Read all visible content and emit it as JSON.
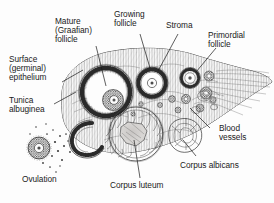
{
  "figure": {
    "ink_color": "#232323",
    "background_color": "#fdfdfd",
    "label_color": "#1a1a1a"
  },
  "labels": {
    "surface_epithelium": {
      "lines": [
        "Surface",
        "(germinal)",
        "epithelium"
      ],
      "line1": "Surface",
      "line2": "(germinal)",
      "line3": "epithelium"
    },
    "mature_follicle": {
      "lines": [
        "Mature",
        "(Graafian)",
        "follicle"
      ],
      "line1": "Mature",
      "line2": "(Graafian)",
      "line3": "follicle"
    },
    "growing_follicle": {
      "lines": [
        "Growing",
        "follicle"
      ],
      "line1": "Growing",
      "line2": "follicle"
    },
    "stroma": {
      "line1": "Stroma"
    },
    "primordial_follicle": {
      "lines": [
        "Primordial",
        "follicle"
      ],
      "line1": "Primordial",
      "line2": "follicle"
    },
    "tunica_albuginea": {
      "lines": [
        "Tunica",
        "albuginea"
      ],
      "line1": "Tunica",
      "line2": "albuginea"
    },
    "blood_vessels": {
      "lines": [
        "Blood",
        "vessels"
      ],
      "line1": "Blood",
      "line2": "vessels"
    },
    "corpus_albicans": {
      "line1": "Corpus albicans"
    },
    "corpus_luteum": {
      "line1": "Corpus luteum"
    },
    "ovulation": {
      "line1": "Ovulation"
    }
  }
}
